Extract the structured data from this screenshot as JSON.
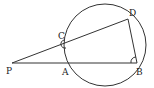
{
  "diagram": {
    "type": "geometry",
    "circle": {
      "cx": 105,
      "cy": 45,
      "r": 41
    },
    "points": {
      "P": {
        "label": "P",
        "x": 12,
        "y": 63,
        "lx": 6,
        "ly": 74
      },
      "A": {
        "label": "A",
        "x": 67,
        "y": 63,
        "lx": 62,
        "ly": 75
      },
      "B": {
        "label": "B",
        "x": 137,
        "y": 63,
        "lx": 136,
        "ly": 75
      },
      "C": {
        "label": "C",
        "x": 66,
        "y": 43,
        "lx": 58,
        "ly": 39
      },
      "D": {
        "label": "D",
        "x": 128,
        "y": 19,
        "lx": 129,
        "ly": 16
      }
    },
    "segments": [
      {
        "from": "P",
        "to": "B"
      },
      {
        "from": "P",
        "to": "D"
      },
      {
        "from": "D",
        "to": "B"
      }
    ],
    "angle_marks": [
      {
        "at": "C",
        "type": "arc"
      },
      {
        "at": "B",
        "type": "arc"
      }
    ]
  }
}
